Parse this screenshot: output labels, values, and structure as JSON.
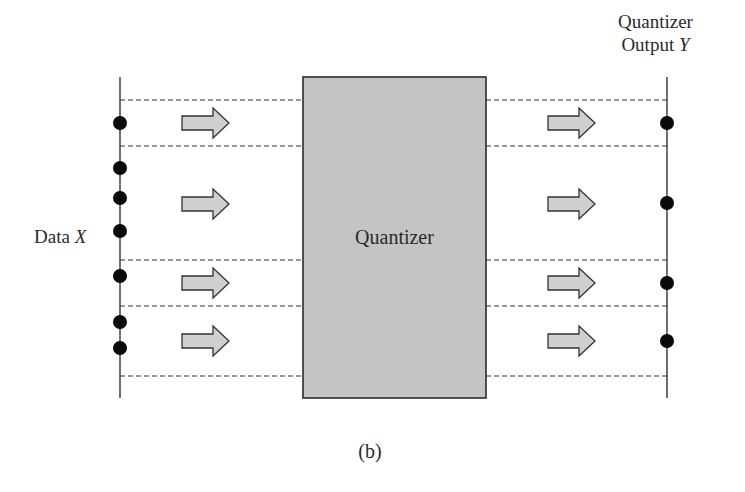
{
  "labels": {
    "input": {
      "text": "Data ",
      "var": "X"
    },
    "output_line1": "Quantizer",
    "output_line2": {
      "text": "Output ",
      "var": "Y"
    },
    "block": "Quantizer",
    "caption": "(b)"
  },
  "colors": {
    "block_fill": "#c4c4c4",
    "block_border": "#2b2b2b",
    "arrow_fill": "#cfcfcf",
    "arrow_border": "#333333",
    "dot": "#0a0a0a",
    "line": "#333333"
  },
  "geometry": {
    "left_axis_x": 120,
    "right_axis_x": 667,
    "axis_top": 77,
    "axis_bottom": 398,
    "block": {
      "x": 303,
      "y": 77,
      "w": 183,
      "h": 321
    },
    "dashed_lines_y": [
      100,
      146,
      260,
      306,
      376
    ],
    "input_points_y": [
      123,
      168,
      198,
      231,
      276,
      322,
      348
    ],
    "output_points_y": [
      123,
      203,
      283,
      341
    ],
    "arrow_rows_y": [
      123,
      204,
      283,
      341
    ],
    "left_arrow_x": 182,
    "right_arrow_x": 548
  }
}
